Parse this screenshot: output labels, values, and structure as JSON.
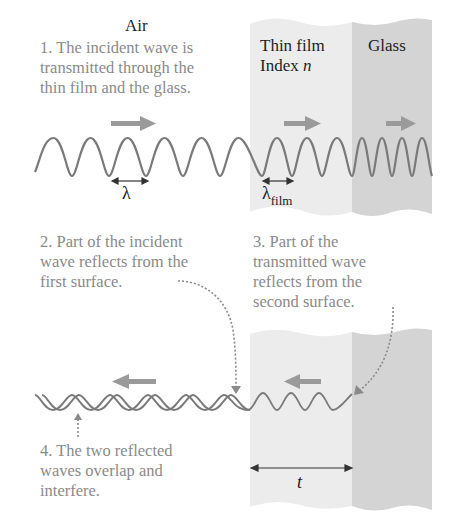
{
  "labels": {
    "air": "Air",
    "thin_film": "Thin film",
    "index": "Index ",
    "index_symbol": "n",
    "glass": "Glass",
    "lambda": "λ",
    "lambda_film_base": "λ",
    "lambda_film_sub": "film",
    "thickness": "t"
  },
  "annotations": {
    "step1": [
      "1. The incident wave is",
      "transmitted through the",
      "thin film and the glass."
    ],
    "step2": [
      "2. Part of the incident",
      "wave reflects from the",
      "first surface."
    ],
    "step3": [
      "3. Part of the",
      "transmitted wave",
      "reflects from the",
      "second surface."
    ],
    "step4": [
      "4. The two reflected",
      "waves overlap and",
      "interfere."
    ]
  },
  "colors": {
    "film_fill": "#ececec",
    "glass_fill": "#d4d4d4",
    "wave": "#7a7a7a",
    "arrow": "#9a9a9a",
    "text_gray": "#8a8a8a",
    "text_dark": "#1e1e1e"
  }
}
